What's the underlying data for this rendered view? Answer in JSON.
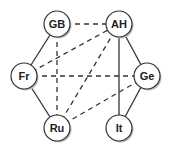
{
  "diagram": {
    "type": "graph",
    "nodes": [
      {
        "id": "GB",
        "label": "GB",
        "x": 57,
        "y": 24
      },
      {
        "id": "AH",
        "label": "AH",
        "x": 119,
        "y": 24
      },
      {
        "id": "Fr",
        "label": "Fr",
        "x": 24,
        "y": 76
      },
      {
        "id": "Ge",
        "label": "Ge",
        "x": 147,
        "y": 76
      },
      {
        "id": "Ru",
        "label": "Ru",
        "x": 57,
        "y": 128
      },
      {
        "id": "It",
        "label": "It",
        "x": 119,
        "y": 128
      }
    ],
    "edges": [
      {
        "from": "GB",
        "to": "Fr",
        "style": "solid"
      },
      {
        "from": "Fr",
        "to": "Ru",
        "style": "solid"
      },
      {
        "from": "AH",
        "to": "Ge",
        "style": "solid"
      },
      {
        "from": "Ge",
        "to": "It",
        "style": "solid"
      },
      {
        "from": "AH",
        "to": "It",
        "style": "solid"
      },
      {
        "from": "GB",
        "to": "AH",
        "style": "dashed"
      },
      {
        "from": "GB",
        "to": "Ru",
        "style": "dashed"
      },
      {
        "from": "Fr",
        "to": "AH",
        "style": "dashed"
      },
      {
        "from": "Fr",
        "to": "Ge",
        "style": "dashed"
      },
      {
        "from": "Ru",
        "to": "AH",
        "style": "dashed"
      },
      {
        "from": "Ru",
        "to": "Ge",
        "style": "dashed"
      }
    ],
    "node_radius": 13,
    "colors": {
      "line": "#333333",
      "node_fill": "#ffffff",
      "node_stroke": "#333333",
      "shadow": "#bbbbbb"
    }
  }
}
